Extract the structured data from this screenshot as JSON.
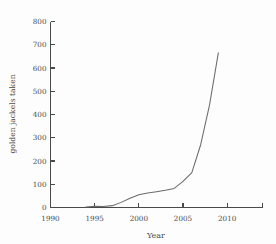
{
  "chart_data": {
    "type": "line",
    "title": "",
    "xlabel": "Year",
    "ylabel": "golden jackels taken",
    "xlim": [
      1990,
      2014
    ],
    "ylim": [
      0,
      800
    ],
    "grid": false,
    "legend": false,
    "xticks": [
      1990,
      1995,
      2000,
      2005,
      2010
    ],
    "xtick_labels": [
      "1990",
      "1995",
      "2000",
      "2005",
      "2010"
    ],
    "yticks": [
      0,
      100,
      200,
      300,
      400,
      500,
      600,
      700,
      800
    ],
    "ytick_labels": [
      "0",
      "100",
      "200",
      "300",
      "400",
      "500",
      "600",
      "700",
      "800"
    ],
    "series": [
      {
        "name": "golden jackels taken",
        "color": "#6b6b6b",
        "x": [
          1994.0,
          1995.0,
          1996.0,
          1997.0,
          1998.0,
          1999.0,
          2000.0,
          2001.0,
          2002.0,
          2003.0,
          2004.0,
          2005.0,
          2006.0,
          2007.0,
          2008.0,
          2009.0
        ],
        "values": [
          2,
          5,
          4,
          8,
          22,
          40,
          55,
          62,
          68,
          74,
          82,
          112,
          150,
          270,
          440,
          665
        ]
      }
    ]
  },
  "axes": {
    "x_axis_name": "x-axis",
    "y_axis_name": "y-axis"
  }
}
